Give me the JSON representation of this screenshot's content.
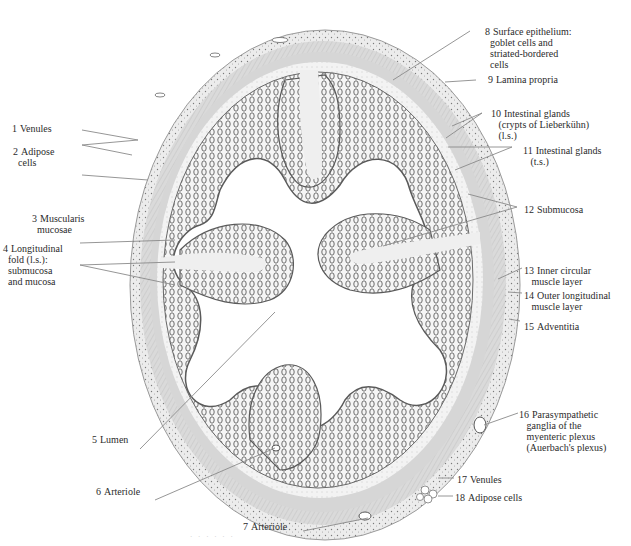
{
  "figure": {
    "colors": {
      "background": "#ffffff",
      "tissue_outer": "#e6e6e6",
      "muscle": "#d2d2d2",
      "submucosa": "#efefef",
      "mucosa_outline": "#6a6a6a",
      "lumen": "#ffffff",
      "leader_line": "#8a8a8a",
      "label_text": "#2b2b2b"
    },
    "caption": "· · ·   · · ·"
  },
  "labels": [
    {
      "num": "1",
      "text": "Venules",
      "x": 12,
      "y": 123
    },
    {
      "num": "2",
      "text": "Adipose\ncells",
      "x": 13,
      "y": 146
    },
    {
      "num": "3",
      "text": "Muscularis\nmucosae",
      "x": 32,
      "y": 213
    },
    {
      "num": "4",
      "text": "Longitudinal\nfold (l.s.):\nsubmucosa\nand mucosa",
      "x": 3,
      "y": 243
    },
    {
      "num": "5",
      "text": "Lumen",
      "x": 92,
      "y": 434
    },
    {
      "num": "6",
      "text": "Arteriole",
      "x": 96,
      "y": 486
    },
    {
      "num": "7",
      "text": "Arteriole",
      "x": 243,
      "y": 521
    },
    {
      "num": "8",
      "text": "Surface epithelium:\ngoblet cells and\nstriated-bordered\ncells",
      "x": 485,
      "y": 26
    },
    {
      "num": "9",
      "text": "Lamina propria",
      "x": 488,
      "y": 74
    },
    {
      "num": "10",
      "text": "Intestinal glands\n(crypts of Lieberkühn)\n(l.s.)",
      "x": 491,
      "y": 108
    },
    {
      "num": "11",
      "text": "Intestinal glands\n(t.s.)",
      "x": 523,
      "y": 145
    },
    {
      "num": "12",
      "text": "Submucosa",
      "x": 524,
      "y": 204
    },
    {
      "num": "13",
      "text": "Inner circular\nmuscle layer",
      "x": 524,
      "y": 265
    },
    {
      "num": "14",
      "text": "Outer longitudinal\nmuscle layer",
      "x": 524,
      "y": 290
    },
    {
      "num": "15",
      "text": "Adventitia",
      "x": 524,
      "y": 321
    },
    {
      "num": "16",
      "text": "Parasympathetic\nganglia of the\nmyenteric plexus\n(Auerbach's plexus)",
      "x": 519,
      "y": 409
    },
    {
      "num": "17",
      "text": "Venules",
      "x": 457,
      "y": 474
    },
    {
      "num": "18",
      "text": "Adipose cells",
      "x": 455,
      "y": 492
    }
  ],
  "leaders": [
    {
      "for": "1",
      "x1": 82,
      "y1": 130,
      "x2": 138,
      "y2": 140
    },
    {
      "for": "2a",
      "x1": 82,
      "y1": 145,
      "x2": 138,
      "y2": 140
    },
    {
      "for": "2b",
      "x1": 82,
      "y1": 145,
      "x2": 132,
      "y2": 155
    },
    {
      "for": "3",
      "x1": 82,
      "y1": 175,
      "x2": 148,
      "y2": 180
    },
    {
      "for": "4a",
      "x1": 80,
      "y1": 243,
      "x2": 175,
      "y2": 240
    },
    {
      "for": "4b",
      "x1": 80,
      "y1": 265,
      "x2": 175,
      "y2": 262
    },
    {
      "for": "4c",
      "x1": 80,
      "y1": 265,
      "x2": 175,
      "y2": 285
    },
    {
      "for": "5",
      "x1": 140,
      "y1": 449,
      "x2": 275,
      "y2": 312
    },
    {
      "for": "6",
      "x1": 155,
      "y1": 500,
      "x2": 275,
      "y2": 448
    },
    {
      "for": "7",
      "x1": 303,
      "y1": 531,
      "x2": 368,
      "y2": 518
    },
    {
      "for": "8",
      "x1": 470,
      "y1": 31,
      "x2": 393,
      "y2": 80
    },
    {
      "for": "9",
      "x1": 476,
      "y1": 80,
      "x2": 445,
      "y2": 82
    },
    {
      "for": "10a",
      "x1": 482,
      "y1": 113,
      "x2": 452,
      "y2": 126
    },
    {
      "for": "10b",
      "x1": 482,
      "y1": 113,
      "x2": 446,
      "y2": 138
    },
    {
      "for": "11a",
      "x1": 512,
      "y1": 147,
      "x2": 448,
      "y2": 147
    },
    {
      "for": "11b",
      "x1": 512,
      "y1": 147,
      "x2": 455,
      "y2": 170
    },
    {
      "for": "12a",
      "x1": 517,
      "y1": 207,
      "x2": 468,
      "y2": 194
    },
    {
      "for": "12b",
      "x1": 517,
      "y1": 207,
      "x2": 383,
      "y2": 246
    },
    {
      "for": "13",
      "x1": 522,
      "y1": 268,
      "x2": 498,
      "y2": 279
    },
    {
      "for": "14",
      "x1": 522,
      "y1": 293,
      "x2": 508,
      "y2": 292
    },
    {
      "for": "15",
      "x1": 520,
      "y1": 321,
      "x2": 509,
      "y2": 319
    },
    {
      "for": "16",
      "x1": 518,
      "y1": 413,
      "x2": 484,
      "y2": 425
    },
    {
      "for": "17",
      "x1": 454,
      "y1": 478,
      "x2": 438,
      "y2": 478
    },
    {
      "for": "18",
      "x1": 453,
      "y1": 496,
      "x2": 438,
      "y2": 496
    }
  ]
}
